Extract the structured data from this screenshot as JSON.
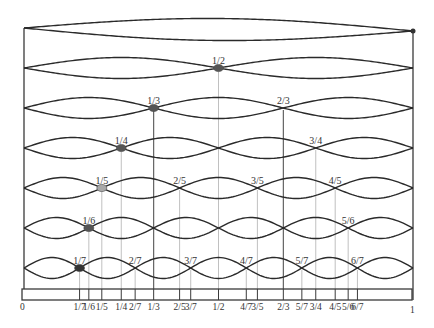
{
  "geometry": {
    "x_left": 24,
    "x_right": 413,
    "row_y_start": 30,
    "row_spacing": 40,
    "amplitude": 11,
    "bar_top": 289,
    "bar_bottom": 300,
    "bar_left": 22,
    "bar_right": 412,
    "axis_label_y": 310
  },
  "colors": {
    "string": "#2a2a2a",
    "frame": "#3a3a3a",
    "guide_light": "#b0b0b0",
    "guide_dark": "#555555",
    "node_dark": "#555555",
    "node_light": "#a8a8a8",
    "node_black": "#333333"
  },
  "harmonics": [
    {
      "n": 1,
      "labels": [],
      "highlight": {
        "frac": "1/1",
        "color": "node_black",
        "small": true
      }
    },
    {
      "n": 2,
      "labels": [
        "1/2"
      ],
      "highlight": {
        "frac": "1/2",
        "color": "node_dark"
      }
    },
    {
      "n": 3,
      "labels": [
        "1/3",
        "2/3"
      ],
      "highlight": {
        "frac": "1/3",
        "color": "node_dark"
      }
    },
    {
      "n": 4,
      "labels": [
        "1/4",
        "3/4"
      ],
      "highlight": {
        "frac": "1/4",
        "color": "node_dark"
      }
    },
    {
      "n": 5,
      "labels": [
        "1/5",
        "2/5",
        "3/5",
        "4/5"
      ],
      "highlight": {
        "frac": "1/5",
        "color": "node_light"
      }
    },
    {
      "n": 6,
      "labels": [
        "1/6",
        "5/6"
      ],
      "highlight": {
        "frac": "1/6",
        "color": "node_dark"
      }
    },
    {
      "n": 7,
      "labels": [
        "1/7",
        "2/7",
        "3/7",
        "4/7",
        "5/7",
        "6/7"
      ],
      "highlight": {
        "frac": "1/7",
        "color": "node_black"
      }
    }
  ],
  "dark_guides": [
    "1/3",
    "2/3"
  ],
  "axis": {
    "start_label": "0",
    "end_label": "1",
    "ticks": [
      "1/7",
      "1/6",
      "1/5",
      "1/4",
      "2/7",
      "1/3",
      "2/5",
      "3/7",
      "1/2",
      "4/7",
      "3/5",
      "2/3",
      "5/7",
      "3/4",
      "4/5",
      "5/6",
      "6/7"
    ]
  }
}
